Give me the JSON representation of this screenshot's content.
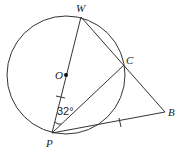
{
  "diagram": {
    "type": "geometry",
    "points": {
      "W": "W",
      "C": "C",
      "O": "O",
      "P": "P",
      "B": "B"
    },
    "angle_label": "32°",
    "elements": [
      "circle centered at O",
      "diameter WP through O",
      "segment WB through C",
      "segment PC",
      "segment PB",
      "tick mark on OP",
      "tick mark on PB",
      "angle arc at P between PW and PC"
    ]
  }
}
